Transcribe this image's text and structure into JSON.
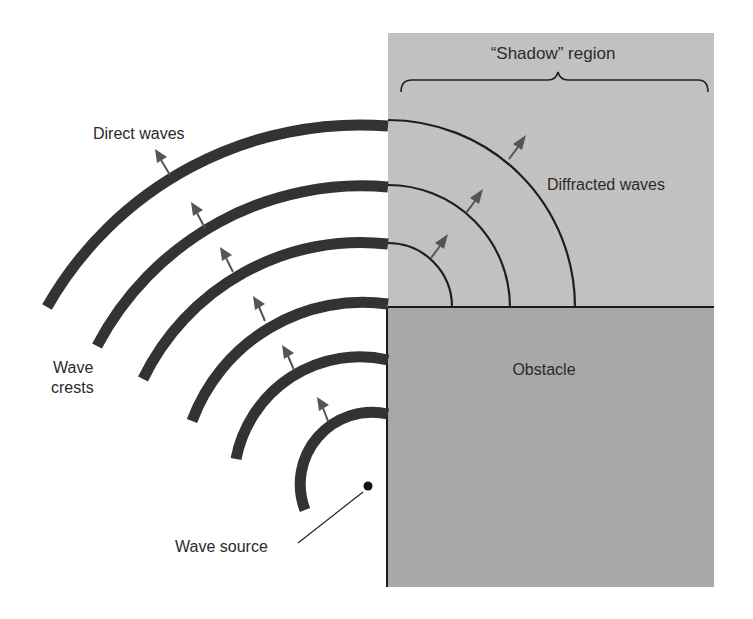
{
  "diagram": {
    "labels": {
      "shadow_region": "“Shadow” region",
      "direct_waves": "Direct waves",
      "diffracted_waves": "Diffracted waves",
      "wave_crests_line1": "Wave",
      "wave_crests_line2": "crests",
      "obstacle": "Obstacle",
      "wave_source": "Wave source"
    },
    "colors": {
      "shadow_fill": "#c2c2c2",
      "obstacle_fill": "#a9a9a9",
      "wave_stroke": "#333333",
      "arrow_fill": "#555555",
      "outline": "#1a1a1a"
    },
    "source": {
      "x": 368,
      "y": 486
    },
    "corner": {
      "x": 388,
      "y": 307
    },
    "direct_wave_radii": [
      360,
      299,
      242,
      182,
      126,
      72
    ],
    "diffracted_wave_radii": [
      64,
      122,
      187
    ]
  }
}
